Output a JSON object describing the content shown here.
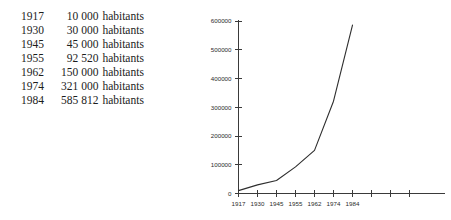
{
  "table": {
    "unit_label": "habitants",
    "rows": [
      {
        "year": "1917",
        "count": "10 000",
        "unit": "habitants"
      },
      {
        "year": "1930",
        "count": "30 000",
        "unit": "habitants"
      },
      {
        "year": "1945",
        "count": "45 000",
        "unit": "habitants"
      },
      {
        "year": "1955",
        "count": "92 520",
        "unit": "habitants"
      },
      {
        "year": "1962",
        "count": "150 000",
        "unit": "habitants"
      },
      {
        "year": "1974",
        "count": "321 000",
        "unit": "habitants"
      },
      {
        "year": "1984",
        "count": "585 812",
        "unit": "habitants"
      }
    ]
  },
  "chart_data": {
    "type": "line",
    "title": "",
    "xlabel": "",
    "ylabel": "",
    "categories": [
      "1917",
      "1930",
      "1945",
      "1955",
      "1962",
      "1974",
      "1984"
    ],
    "values": [
      10000,
      30000,
      45000,
      92520,
      150000,
      321000,
      585812
    ],
    "series": [
      {
        "name": "habitants",
        "values": [
          10000,
          30000,
          45000,
          92520,
          150000,
          321000,
          585812
        ],
        "color": "#2e2e2e"
      }
    ],
    "ylim": [
      0,
      600000
    ],
    "ytick_labels": [
      "0",
      "100000",
      "200000",
      "300000",
      "400000",
      "500000",
      "600000"
    ],
    "ytick_values": [
      0,
      100000,
      200000,
      300000,
      400000,
      500000,
      600000
    ],
    "xtick_labels": [
      "1917",
      "1930",
      "1945",
      "1955",
      "1962",
      "1974",
      "1984",
      "",
      "",
      ""
    ],
    "extra_unlabeled_xticks": 3,
    "grid": false,
    "legend": false,
    "axis_color": "#3a3a3a"
  }
}
